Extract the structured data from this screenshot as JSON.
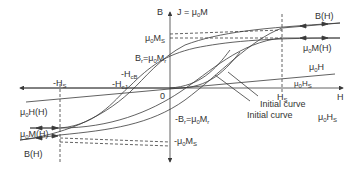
{
  "diagram": {
    "type": "magnetic-hysteresis-loop",
    "colors": {
      "line": "#3a3a3a",
      "text": "#333333",
      "background": "#ffffff"
    },
    "axes": {
      "vertical_label": "B",
      "vertical_label2": "J = μ",
      "vertical_label2_sub": "0",
      "vertical_label2_tail": "M",
      "horizontal_label": "H",
      "origin_label": "0"
    },
    "labels": {
      "ms_pos": {
        "pre": "μ",
        "sub": "0",
        "mid": "M",
        "sub2": "S"
      },
      "br": {
        "pre": "B",
        "sub": "r",
        "mid": "=μ",
        "sub2": "0",
        "tail": "M",
        "sub3": "r"
      },
      "hcb": {
        "pre": "-H",
        "sub": "cB"
      },
      "hcj": {
        "pre": "-H",
        "sub": "cJ"
      },
      "neg_hs": {
        "pre": "-H",
        "sub": "S"
      },
      "hs": {
        "pre": "H",
        "sub": "S"
      },
      "bh_right": "B(H)",
      "mh_right": {
        "pre": "μ",
        "sub": "0",
        "tail": "M(H)"
      },
      "muh_right": {
        "pre": "μ",
        "sub": "0",
        "tail": "H"
      },
      "muhs_small": {
        "pre": "μ",
        "sub": "0",
        "tail": "H",
        "sub2": "S"
      },
      "initial_curve_1": "Initial curve",
      "initial_curve_2": "Initial curve",
      "muhs_right": {
        "pre": "μ",
        "sub": "0",
        "tail": "H",
        "sub2": "S"
      },
      "muhh_left": {
        "pre": "μ",
        "sub": "0",
        "tail": "H(H)"
      },
      "mh_left": {
        "pre": "μ",
        "sub": "0",
        "tail": "M(H)"
      },
      "bh_left": "B(H)",
      "neg_br": {
        "pre": "-B",
        "sub": "r",
        "mid": "=μ",
        "sub2": "0",
        "tail": "M",
        "sub3": "r"
      },
      "ms_neg": {
        "pre": "-μ",
        "sub": "0",
        "mid": "M",
        "sub2": "S"
      }
    }
  }
}
